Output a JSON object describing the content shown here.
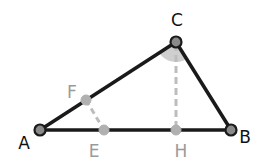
{
  "diagram": {
    "colors": {
      "main_stroke": "#1a1a1a",
      "secondary_stroke": "#bdbdbd",
      "main_point_fill": "#8a8a8a",
      "secondary_point_fill": "#b0b0b0",
      "angle_fill": "#cfcfcf",
      "main_label": "#111111",
      "secondary_label": "#9a9a9a"
    },
    "points": {
      "A": {
        "label": "A",
        "x": 40,
        "y": 130
      },
      "B": {
        "label": "B",
        "x": 231,
        "y": 130
      },
      "C": {
        "label": "C",
        "x": 176,
        "y": 42
      },
      "F": {
        "label": "F",
        "x": 86,
        "y": 100
      },
      "E": {
        "label": "E",
        "x": 104,
        "y": 130
      },
      "H": {
        "label": "H",
        "x": 176,
        "y": 130
      }
    },
    "segments": [
      {
        "from": "A",
        "to": "B",
        "style": "solid"
      },
      {
        "from": "B",
        "to": "C",
        "style": "solid"
      },
      {
        "from": "C",
        "to": "A",
        "style": "solid"
      },
      {
        "from": "C",
        "to": "H",
        "style": "dashed"
      },
      {
        "from": "F",
        "to": "E",
        "style": "dashed"
      }
    ],
    "angle_marks": [
      {
        "vertex": "C",
        "between": [
          "A",
          "B"
        ],
        "filled": true
      }
    ]
  }
}
